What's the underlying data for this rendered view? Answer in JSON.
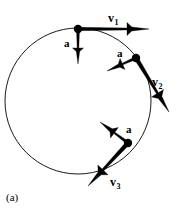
{
  "figure": {
    "caption": "(a)",
    "caption_position": {
      "x": 6,
      "y": 192
    },
    "background_color": "#ffffff",
    "stroke_color": "#000000",
    "circle": {
      "center_x": 78,
      "center_y": 101,
      "radius": 73,
      "stroke_width": 0.9,
      "fill": "none"
    },
    "points": [
      {
        "id": "point-1",
        "x": 78,
        "y": 29,
        "dot_radius": 4.2,
        "velocity": {
          "label": "v",
          "subscript": "1",
          "tip_x": 149,
          "tip_y": 29,
          "label_x": 108,
          "label_y": 12,
          "shaft_width": 3.4,
          "head_length": 22,
          "head_half_width": 6.5
        },
        "acceleration": {
          "label": "a",
          "tip_x": 78,
          "tip_y": 64,
          "label_x": 64,
          "label_y": 38,
          "shaft_width": 3.0,
          "head_length": 16,
          "head_half_width": 5.5
        }
      },
      {
        "id": "point-2",
        "x": 136,
        "y": 58,
        "dot_radius": 4.2,
        "velocity": {
          "label": "v",
          "subscript": "2",
          "tip_x": 169,
          "tip_y": 112,
          "label_x": 152,
          "label_y": 76,
          "shaft_width": 4.2,
          "head_length": 22,
          "head_half_width": 7.0
        },
        "acceleration": {
          "label": "a",
          "tip_x": 107,
          "tip_y": 71,
          "label_x": 117,
          "label_y": 48,
          "shaft_width": 3.0,
          "head_length": 17,
          "head_half_width": 6.0
        }
      },
      {
        "id": "point-3",
        "x": 128,
        "y": 143,
        "dot_radius": 4.2,
        "velocity": {
          "label": "v",
          "subscript": "3",
          "tip_x": 88,
          "tip_y": 186,
          "label_x": 110,
          "label_y": 176,
          "shaft_width": 4.2,
          "head_length": 22,
          "head_half_width": 7.0
        },
        "acceleration": {
          "label": "a",
          "tip_x": 100,
          "tip_y": 122,
          "label_x": 126,
          "label_y": 124,
          "shaft_width": 3.0,
          "head_length": 18,
          "head_half_width": 6.5
        }
      }
    ]
  }
}
